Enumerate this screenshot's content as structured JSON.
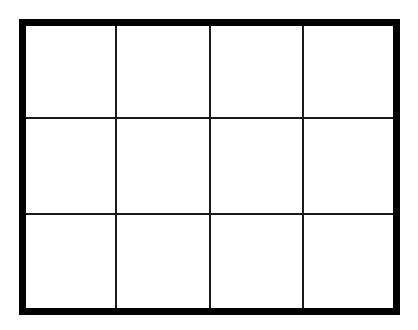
{
  "grid": {
    "rows": 3,
    "columns": 4,
    "border_color": "#000000",
    "line_color": "#1a1a1a",
    "background": "#ffffff",
    "cells": [
      [
        "",
        "",
        "",
        ""
      ],
      [
        "",
        "",
        "",
        ""
      ],
      [
        "",
        "",
        "",
        ""
      ]
    ]
  }
}
